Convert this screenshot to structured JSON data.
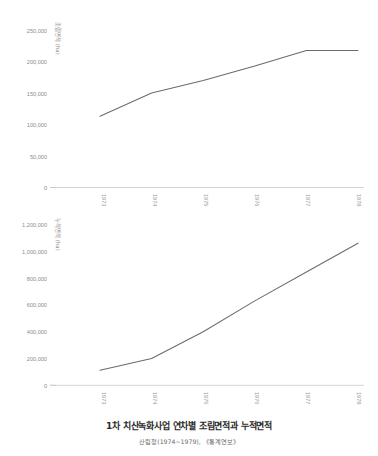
{
  "caption": {
    "title": "1차 치산녹화사업 연차별 조림면적과 누적면적",
    "source": "산림청(1974~1979), 《통계연보》"
  },
  "chart_data": [
    {
      "type": "line",
      "id": "annual-afforestation-area",
      "title": "",
      "xlabel": "",
      "ylabel": "조림면적 (ha)",
      "x": [
        "1973",
        "1974",
        "1975",
        "1976",
        "1977",
        "1978"
      ],
      "categories": [
        "1973",
        "1974",
        "1975",
        "1976",
        "1977",
        "1978"
      ],
      "values": [
        113000,
        150000,
        170000,
        193000,
        218000,
        218000
      ],
      "series": [
        {
          "name": "조림면적",
          "values": [
            113000,
            150000,
            170000,
            193000,
            218000,
            218000
          ]
        }
      ],
      "ylim": [
        0,
        250000
      ],
      "yticks": [
        0,
        50000,
        100000,
        150000,
        200000,
        250000
      ],
      "ytick_labels": [
        "0",
        "50,000",
        "100,000",
        "150,000",
        "200,000",
        "250,000"
      ],
      "grid": false,
      "legend": "none"
    },
    {
      "type": "line",
      "id": "cumulative-afforestation-area",
      "title": "",
      "xlabel": "",
      "ylabel": "누적면적 (ha)",
      "x": [
        "1973",
        "1974",
        "1975",
        "1976",
        "1977",
        "1978"
      ],
      "categories": [
        "1973",
        "1974",
        "1975",
        "1976",
        "1977",
        "1978"
      ],
      "values": [
        113000,
        200000,
        400000,
        630000,
        845000,
        1060000
      ],
      "series": [
        {
          "name": "누적면적",
          "values": [
            113000,
            200000,
            400000,
            630000,
            845000,
            1060000
          ]
        }
      ],
      "ylim": [
        0,
        1200000
      ],
      "yticks": [
        0,
        200000,
        400000,
        600000,
        800000,
        1000000,
        1200000
      ],
      "ytick_labels": [
        "0",
        "200,000",
        "400,000",
        "600,000",
        "800,000",
        "1,000,000",
        "1,200,000"
      ],
      "grid": false,
      "legend": "none"
    }
  ],
  "colors": {
    "line": "#6b6b6b",
    "axis": "#c9c9c9",
    "tick_text": "#8c8c8c",
    "title_text": "#2a2a2a",
    "source_text": "#6a6a6a",
    "background": "#ffffff"
  }
}
